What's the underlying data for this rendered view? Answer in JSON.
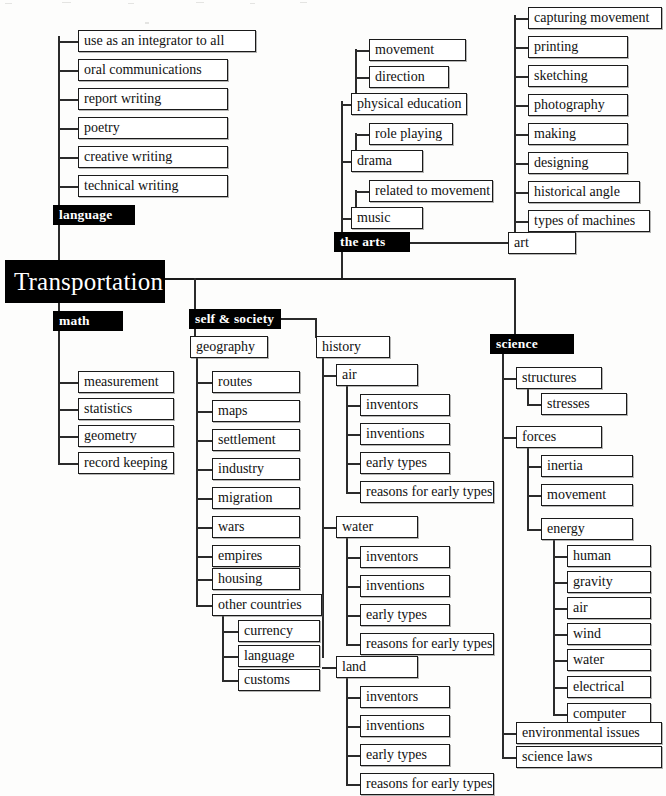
{
  "diagram": {
    "title": "Transportation",
    "type": "curriculum-mind-map",
    "root_label": "Transportation",
    "colors": {
      "category_fill": "#000000",
      "category_text": "#ffffff",
      "leaf_fill": "#ffffff",
      "leaf_border": "#1a1a1a",
      "line": "#2b2b2b",
      "background": "#ffffff"
    },
    "categories": {
      "language": "language",
      "the_arts": "the arts",
      "math": "math",
      "self_and_society": "self & society",
      "science": "science"
    },
    "nodes": {
      "language_children": [
        "use as an integrator to all",
        "oral communications",
        "report writing",
        "poetry",
        "creative writing",
        "technical writing"
      ],
      "arts": {
        "physical_education": "physical education",
        "physical_education_children": [
          "movement",
          "direction"
        ],
        "drama": "drama",
        "drama_children": [
          "role playing"
        ],
        "music": "music",
        "music_children": [
          "related to movement"
        ],
        "art": "art",
        "art_children": [
          "capturing movement",
          "printing",
          "sketching",
          "photography",
          "making",
          "designing",
          "historical angle",
          "types of machines"
        ]
      },
      "math_children": [
        "measurement",
        "statistics",
        "geometry",
        "record keeping"
      ],
      "self_and_society": {
        "geography": "geography",
        "geography_children": [
          "routes",
          "maps",
          "settlement",
          "industry",
          "migration",
          "wars",
          "empires",
          "housing",
          "other countries"
        ],
        "other_countries_children": [
          "currency",
          "language",
          "customs"
        ],
        "history": "history",
        "history_children": [
          "air",
          "water",
          "land"
        ],
        "air_children": [
          "inventors",
          "inventions",
          "early types",
          "reasons for early types"
        ],
        "water_children": [
          "inventors",
          "inventions",
          "early types",
          "reasons for early types"
        ],
        "land_children": [
          "inventors",
          "inventions",
          "early types",
          "reasons for early types"
        ]
      },
      "science": {
        "structures": "structures",
        "structures_children": [
          "stresses"
        ],
        "forces": "forces",
        "forces_children": [
          "inertia",
          "movement",
          "energy"
        ],
        "energy_children": [
          "human",
          "gravity",
          "air",
          "wind",
          "water",
          "electrical",
          "computer"
        ],
        "environmental_issues": "environmental issues",
        "science_laws": "science laws"
      }
    }
  }
}
